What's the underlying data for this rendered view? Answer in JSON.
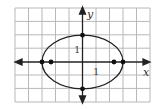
{
  "figure": {
    "type": "ellipse-graph",
    "equation_hint": "x^2/9 + y^2/4 = 1",
    "axes": {
      "x_label": "x",
      "y_label": "y",
      "x_tick_label": "1",
      "y_tick_label": "1",
      "x_range": [
        -6,
        4
      ],
      "y_range": [
        -3,
        4
      ]
    },
    "ellipse": {
      "center": [
        0,
        0
      ],
      "semi_major_x": 3,
      "semi_minor_y": 2
    },
    "points": [
      {
        "name": "vertex-left",
        "x": -3,
        "y": 0
      },
      {
        "name": "vertex-right",
        "x": 3,
        "y": 0
      },
      {
        "name": "co-vertex-top",
        "x": 0,
        "y": 2
      },
      {
        "name": "co-vertex-bottom",
        "x": 0,
        "y": -2
      },
      {
        "name": "focus-left",
        "x": -2.24,
        "y": 0
      },
      {
        "name": "focus-right",
        "x": 2.24,
        "y": 0
      }
    ],
    "colors": {
      "grid": "#b8b8b8",
      "axis": "#222222",
      "curve": "#222222",
      "background": "#ffffff"
    }
  }
}
